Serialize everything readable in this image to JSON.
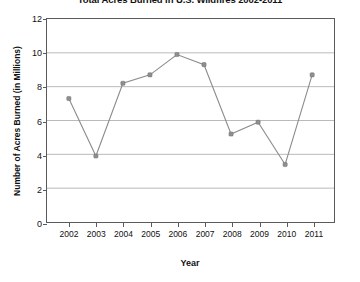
{
  "chart_data": {
    "type": "line",
    "title": "Total Acres Burned in U.S. Wildfires 2002-2011",
    "xlabel": "Year",
    "ylabel": "Number of Acres Burned (in Millions)",
    "categories": [
      "2002",
      "2003",
      "2004",
      "2005",
      "2006",
      "2007",
      "2008",
      "2009",
      "2010",
      "2011"
    ],
    "x": [
      2002,
      2003,
      2004,
      2005,
      2006,
      2007,
      2008,
      2009,
      2010,
      2011
    ],
    "values": [
      7.3,
      3.9,
      8.2,
      8.7,
      9.9,
      9.3,
      5.2,
      5.9,
      3.4,
      8.7
    ],
    "series": [
      {
        "name": "Acres Burned",
        "values": [
          7.3,
          3.9,
          8.2,
          8.7,
          9.9,
          9.3,
          5.2,
          5.9,
          3.4,
          8.7
        ]
      }
    ],
    "ylim": [
      0,
      12
    ],
    "yticks": [
      0,
      2,
      4,
      6,
      8,
      10,
      12
    ],
    "ytick_labels": [
      "0",
      "2",
      "4",
      "6",
      "8",
      "10",
      "12"
    ],
    "xtick_labels": [
      "2002",
      "2003",
      "2004",
      "2005",
      "2006",
      "2007",
      "2008",
      "2009",
      "2010",
      "2011"
    ],
    "grid": "horizontal",
    "legend": "none",
    "marker": "square",
    "line_color": "#8c8c8c",
    "marker_color": "#8f8f8f",
    "grid_color": "#a8a8a8",
    "axis_color": "#5a5a5a",
    "background_color": "#ffffff"
  }
}
